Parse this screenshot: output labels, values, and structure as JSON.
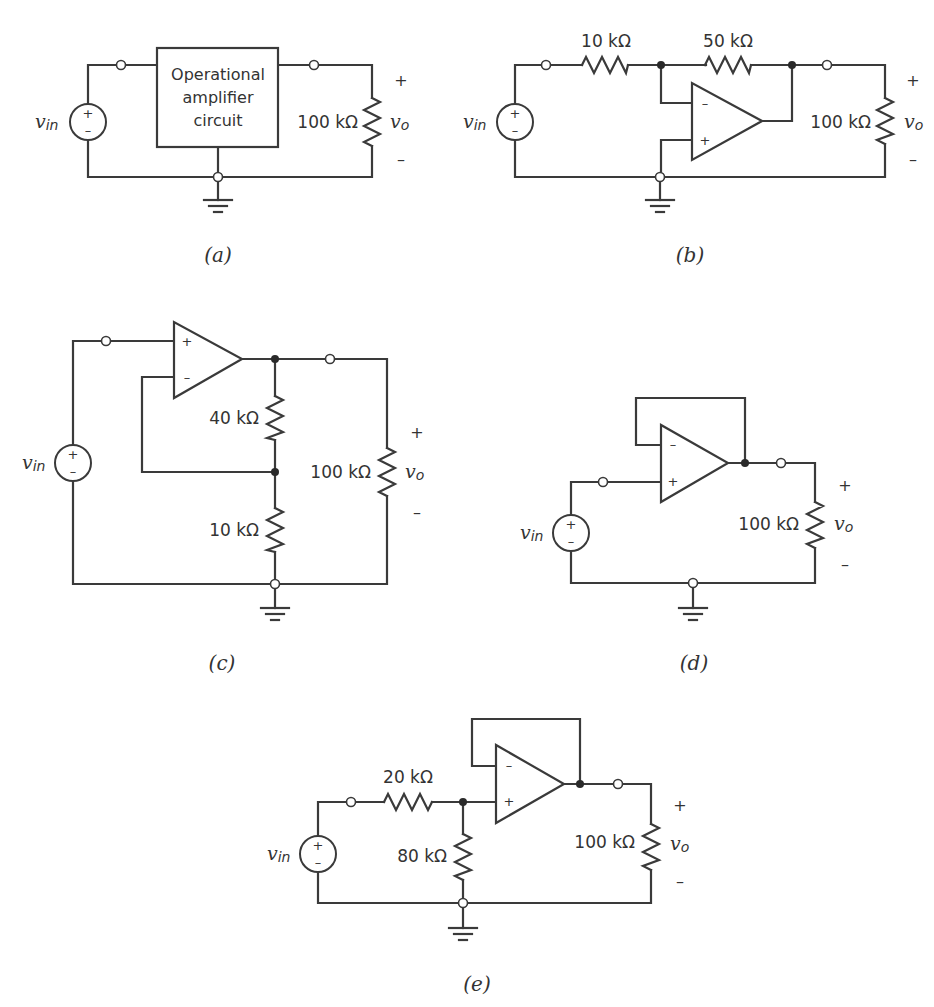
{
  "figure": {
    "panels": [
      {
        "id": "a",
        "caption": "(a)",
        "source": {
          "label": "v",
          "subscript": "in",
          "plus": "+",
          "minus": "–"
        },
        "block": {
          "line1": "Operational",
          "line2": "amplifier",
          "line3": "circuit"
        },
        "load": {
          "value": "100 kΩ"
        },
        "output": {
          "label": "v",
          "subscript": "o",
          "plus": "+",
          "minus": "–"
        }
      },
      {
        "id": "b",
        "caption": "(b)",
        "type": "inverting amplifier",
        "source": {
          "label": "v",
          "subscript": "in",
          "plus": "+",
          "minus": "–"
        },
        "input_resistor": "10 kΩ",
        "feedback_resistor": "50 kΩ",
        "opamp": {
          "inv": "–",
          "noninv": "+"
        },
        "load": {
          "value": "100 kΩ"
        },
        "output": {
          "label": "v",
          "subscript": "o",
          "plus": "+",
          "minus": "–"
        }
      },
      {
        "id": "c",
        "caption": "(c)",
        "type": "noninverting amplifier",
        "source": {
          "label": "v",
          "subscript": "in",
          "plus": "+",
          "minus": "–"
        },
        "opamp": {
          "inv": "–",
          "noninv": "+"
        },
        "top_resistor": "40 kΩ",
        "bottom_resistor": "10 kΩ",
        "load": {
          "value": "100 kΩ"
        },
        "output": {
          "label": "v",
          "subscript": "o",
          "plus": "+",
          "minus": "–"
        }
      },
      {
        "id": "d",
        "caption": "(d)",
        "type": "voltage follower",
        "source": {
          "label": "v",
          "subscript": "in",
          "plus": "+",
          "minus": "–"
        },
        "opamp": {
          "inv": "–",
          "noninv": "+"
        },
        "load": {
          "value": "100 kΩ"
        },
        "output": {
          "label": "v",
          "subscript": "o",
          "plus": "+",
          "minus": "–"
        }
      },
      {
        "id": "e",
        "caption": "(e)",
        "type": "voltage divider + follower",
        "source": {
          "label": "v",
          "subscript": "in",
          "plus": "+",
          "minus": "–"
        },
        "series_resistor": "20 kΩ",
        "shunt_resistor": "80 kΩ",
        "opamp": {
          "inv": "–",
          "noninv": "+"
        },
        "load": {
          "value": "100 kΩ"
        },
        "output": {
          "label": "v",
          "subscript": "o",
          "plus": "+",
          "minus": "–"
        }
      }
    ]
  }
}
